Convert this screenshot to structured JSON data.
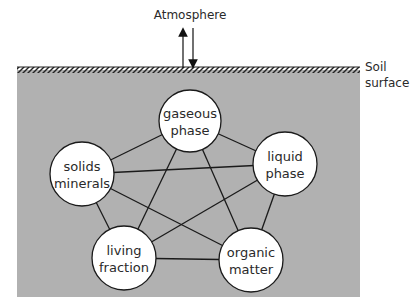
{
  "diagram": {
    "title_top": "Atmosphere",
    "surface_label": [
      "Soil",
      "surface"
    ],
    "colors": {
      "soil_fill": "#b1b1b1",
      "circle_fill": "#ffffff",
      "line": "#1a1a1a",
      "text": "#2a2a2a"
    },
    "nodes": [
      {
        "id": "gaseous",
        "lines": [
          "gaseous",
          "phase"
        ],
        "cx": 190,
        "cy": 121,
        "r": 31
      },
      {
        "id": "liquid",
        "lines": [
          "liquid",
          "phase"
        ],
        "cx": 285,
        "cy": 164,
        "r": 32
      },
      {
        "id": "organic",
        "lines": [
          "organic",
          "matter"
        ],
        "cx": 251,
        "cy": 260,
        "r": 32
      },
      {
        "id": "living",
        "lines": [
          "living",
          "fraction"
        ],
        "cx": 124,
        "cy": 258,
        "r": 32
      },
      {
        "id": "solids",
        "lines": [
          "solids",
          "minerals"
        ],
        "cx": 82,
        "cy": 174,
        "r": 32
      }
    ],
    "edges": [
      [
        "gaseous",
        "liquid"
      ],
      [
        "gaseous",
        "organic"
      ],
      [
        "gaseous",
        "living"
      ],
      [
        "gaseous",
        "solids"
      ],
      [
        "liquid",
        "organic"
      ],
      [
        "liquid",
        "living"
      ],
      [
        "liquid",
        "solids"
      ],
      [
        "organic",
        "living"
      ],
      [
        "organic",
        "solids"
      ],
      [
        "living",
        "solids"
      ]
    ],
    "exchange_arrows": [
      "up",
      "down"
    ]
  }
}
